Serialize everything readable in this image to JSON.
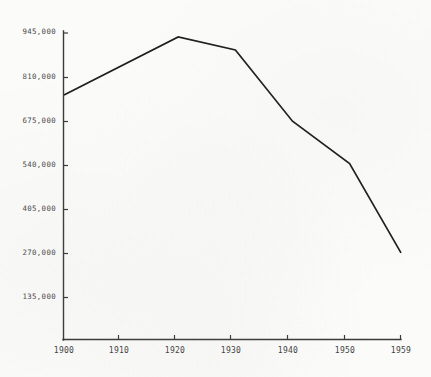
{
  "chart_data": {
    "type": "line",
    "title": "",
    "subtitle": "",
    "xlabel": "",
    "ylabel": "",
    "x": [
      1900,
      1920,
      1930,
      1940,
      1950,
      1959
    ],
    "values": [
      755000,
      933000,
      893000,
      675000,
      545000,
      272000
    ],
    "series": [
      {
        "name": "",
        "x": [
          1900,
          1920,
          1930,
          1940,
          1950,
          1959
        ],
        "values": [
          755000,
          933000,
          893000,
          675000,
          545000,
          272000
        ]
      }
    ],
    "xlim": [
      1900,
      1959
    ],
    "ylim": [
      45000,
      945000
    ],
    "grid": false,
    "legend": false,
    "legend_position": "none",
    "x_tick_labels": [
      "1900",
      "1910",
      "1920",
      "1930",
      "1940",
      "1950",
      "1959"
    ],
    "x_tick_values": [
      1900,
      1910,
      1920,
      1930,
      1940,
      1950,
      1959
    ],
    "y_tick_labels": [
      "135,000",
      "270,000",
      "405,000",
      "540,000",
      "675,000",
      "810,000",
      "945,000"
    ],
    "y_tick_values": [
      135000,
      270000,
      405000,
      540000,
      675000,
      810000,
      945000
    ],
    "line_color": "#1e1e1e",
    "axis_color": "#3a3a3a",
    "background_color": "#fbfbfa"
  },
  "axes": {
    "y_ticks": [
      {
        "label": "945,000",
        "value": 945000
      },
      {
        "label": "810,000",
        "value": 810000
      },
      {
        "label": "675,000",
        "value": 675000
      },
      {
        "label": "540,000",
        "value": 540000
      },
      {
        "label": "405,000",
        "value": 405000
      },
      {
        "label": "270,000",
        "value": 270000
      },
      {
        "label": "135,000",
        "value": 135000
      }
    ],
    "x_ticks": [
      {
        "label": "1900",
        "value": 1900
      },
      {
        "label": "1910",
        "value": 1910
      },
      {
        "label": "1920",
        "value": 1920
      },
      {
        "label": "1930",
        "value": 1930
      },
      {
        "label": "1940",
        "value": 1940
      },
      {
        "label": "1950",
        "value": 1950
      },
      {
        "label": "1959",
        "value": 1959
      }
    ]
  }
}
